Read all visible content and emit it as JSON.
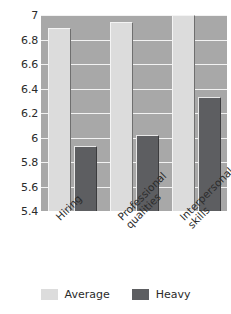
{
  "chart_data": {
    "type": "bar",
    "title": "",
    "subtitle": "",
    "xlabel": "",
    "ylabel": "",
    "categories": [
      "Hiring",
      "Professional qualities",
      "Interpersonal skills"
    ],
    "series": [
      {
        "name": "Average",
        "values": [
          6.89,
          6.94,
          7.0
        ],
        "color": "#dcdcdc"
      },
      {
        "name": "Heavy",
        "values": [
          5.93,
          6.02,
          6.33
        ],
        "color": "#5d5e61"
      }
    ],
    "ylim": [
      5.4,
      7.0
    ],
    "ytick_step": 0.2,
    "ytick_labels": [
      "7",
      "6.8",
      "6.6",
      "6.4",
      "6.2",
      "6",
      "5.8",
      "5.6",
      "5.4"
    ],
    "ytick_values": [
      7,
      6.8,
      6.6,
      6.4,
      6.2,
      6,
      5.8,
      5.6,
      5.4
    ],
    "grid": true,
    "grid_color": "#f2f2f2",
    "plot_background": "#a8a8a8",
    "legend_position": "bottom",
    "legend": [
      "Average",
      "Heavy"
    ]
  },
  "category_label_lines": [
    [
      "Hiring",
      ""
    ],
    [
      "Professional",
      "qualities"
    ],
    [
      "Interpersonal",
      "skills"
    ]
  ]
}
